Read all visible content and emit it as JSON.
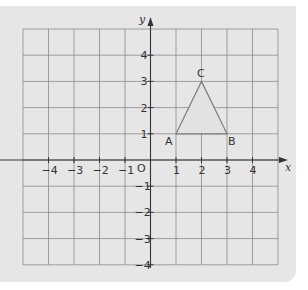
{
  "diagram": {
    "type": "coordinate-grid",
    "x_axis": {
      "label": "x",
      "min": -5,
      "max": 5,
      "tick_labels": [
        "-4",
        "-3",
        "-2",
        "-1",
        "1",
        "2",
        "3",
        "4"
      ]
    },
    "y_axis": {
      "label": "y",
      "min": -4,
      "max": 5,
      "tick_labels": [
        "4",
        "3",
        "2",
        "1",
        "-1",
        "-2",
        "-3",
        "-4"
      ]
    },
    "origin_label": "O",
    "shape": {
      "type": "triangle",
      "vertices": [
        {
          "label": "A",
          "x": 1,
          "y": 1
        },
        {
          "label": "B",
          "x": 3,
          "y": 1
        },
        {
          "label": "C",
          "x": 2,
          "y": 3
        }
      ]
    },
    "colors": {
      "background": "#e6e6e6",
      "grid": "#8a8a8a",
      "axis": "#333333",
      "triangle_stroke": "#7a7a7a",
      "triangle_fill": "#e2e2e2"
    }
  }
}
